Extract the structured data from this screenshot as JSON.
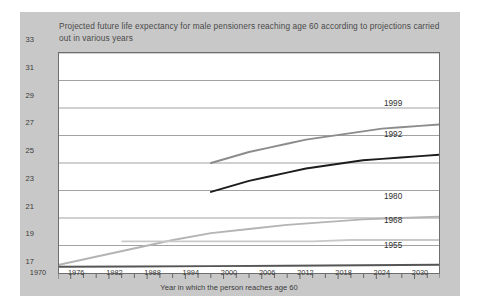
{
  "chart_data": {
    "type": "line",
    "title": "Projected future life expectancy for male pensioners reaching age 60 according to projections carried out in various years",
    "xlabel": "Year in which the person reaches age 60",
    "ylabel": "Projected further years of life",
    "xlim": [
      1970,
      2030
    ],
    "ylim": [
      17,
      33
    ],
    "xticks": [
      1970,
      1976,
      1982,
      1988,
      1994,
      2000,
      2006,
      2012,
      2018,
      2024,
      2030
    ],
    "yticks": [
      17,
      19,
      21,
      23,
      25,
      27,
      29,
      31,
      33
    ],
    "grid": "horizontal",
    "legend_position": "right-inline-end-labels",
    "series": [
      {
        "name": "1999",
        "color": "#8c8c8c",
        "x": [
          1994,
          1997,
          2000,
          2003,
          2006,
          2009,
          2012,
          2015,
          2018,
          2021,
          2024,
          2027,
          2030
        ],
        "values": [
          25.0,
          25.4,
          25.8,
          26.1,
          26.4,
          26.7,
          26.9,
          27.1,
          27.3,
          27.5,
          27.6,
          27.7,
          27.8
        ]
      },
      {
        "name": "1992",
        "color": "#1c1c1c",
        "x": [
          1994,
          1997,
          2000,
          2003,
          2006,
          2009,
          2012,
          2015,
          2018,
          2021,
          2024,
          2027,
          2030
        ],
        "values": [
          22.9,
          23.3,
          23.7,
          24.0,
          24.3,
          24.6,
          24.8,
          25.0,
          25.2,
          25.3,
          25.4,
          25.5,
          25.6
        ]
      },
      {
        "name": "1980",
        "color": "#b4b4b4",
        "x": [
          1970,
          1976,
          1982,
          1988,
          1994,
          2000,
          2006,
          2012,
          2018,
          2024,
          2030
        ],
        "values": [
          17.6,
          18.2,
          18.8,
          19.4,
          19.9,
          20.2,
          20.5,
          20.7,
          20.9,
          21.0,
          21.1
        ]
      },
      {
        "name": "1968",
        "color": "#c9c9c9",
        "x": [
          1980,
          1986,
          1992,
          1998,
          2004,
          2010,
          2016,
          2022,
          2030
        ],
        "values": [
          19.3,
          19.3,
          19.3,
          19.3,
          19.3,
          19.3,
          19.4,
          19.4,
          19.4
        ]
      },
      {
        "name": "1955",
        "color": "#555555",
        "x": [
          1970,
          1982,
          1994,
          2006,
          2018,
          2030
        ],
        "values": [
          17.45,
          17.47,
          17.5,
          17.53,
          17.56,
          17.6
        ]
      }
    ]
  },
  "axis": {
    "y_title": "Projected further years of life",
    "x_title": "Year in which the person reaches age 60",
    "y_labels": [
      "33",
      "31",
      "29",
      "27",
      "25",
      "23",
      "21",
      "19",
      "17"
    ],
    "x_labels": [
      "1970",
      "1976",
      "1982",
      "1988",
      "1994",
      "2000",
      "2006",
      "2012",
      "2018",
      "2024",
      "2030"
    ]
  },
  "series_labels": [
    {
      "text": "1999"
    },
    {
      "text": "1992"
    },
    {
      "text": "1980"
    },
    {
      "text": "1968"
    },
    {
      "text": "1955"
    }
  ]
}
